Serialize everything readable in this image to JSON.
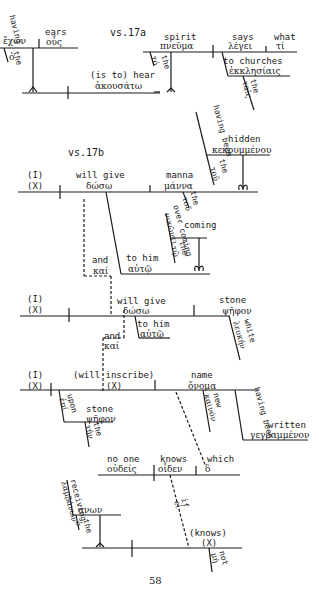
{
  "page": {
    "page_number": "58"
  },
  "verse_17a": {
    "label": "vs.17a",
    "subject": {
      "english": "having",
      "english2": "ears",
      "greek": "ἔχων",
      "participle_english": "having",
      "object_english": "ears",
      "object_greek": "ὦτα"
    },
    "having_label": "having",
    "having_greek": "ἔχων",
    "ears_label": "ears",
    "ears_greek": "οὖς",
    "the_label": "the",
    "the_greek": "ὁ",
    "hear_label": "(is to) hear",
    "hear_greek": "ἀκουσάτω",
    "spirit_label": "spirit",
    "spirit_greek": "πνεῦμα",
    "spirit_the_label": "the",
    "spirit_the_greek": "τό",
    "says_label": "says",
    "says_greek": "λέγει",
    "what_label": "what",
    "what_greek": "τί",
    "churches_label": "to churches",
    "churches_greek": "ἐκκλησίαις",
    "churches_the_label": "the",
    "churches_the_greek": "ταῖς"
  },
  "hidden_clause": {
    "having_been_label": "having been",
    "hidden_label": "hidden",
    "greek": "κεκρυμμένου",
    "the_label": "the",
    "the_greek": "τοῦ"
  },
  "verse_17b": {
    "label": "vs.17b",
    "subject_label": "(I)",
    "subject_x": "(X)",
    "verb_label": "will give",
    "verb_greek": "δώσω",
    "manna_label": "manna",
    "manna_greek": "μάννα",
    "manna_the_label": "the",
    "manna_the_greek": "τοῦ",
    "to_him_label": "to him",
    "to_him_greek": "αὐτῷ",
    "and_label": "and",
    "and_greek": "καί",
    "overcoming_label": "over coming",
    "overcoming_greek": "νικῶντι",
    "overcoming_the_label": "the",
    "overcoming_the_greek": "τῷ"
  },
  "clause_2": {
    "subject_label": "(I)",
    "subject_x": "(X)",
    "verb_label": "will give",
    "verb_greek": "δώσω",
    "to_him_label": "to him",
    "to_him_greek": "αὐτῷ",
    "stone_label": "stone",
    "stone_greek": "ψῆφον",
    "white_label": "white",
    "white_greek": "λευκήν",
    "and_label": "and",
    "and_greek": "καί"
  },
  "clause_3": {
    "subject_label": "(I)",
    "subject_x": "(X)",
    "verb_label": "(will inscribe)",
    "verb_x": "(X)",
    "name_label": "name",
    "name_greek": "ὄνομα",
    "upon_label": "upon",
    "upon_greek": "ἐπί",
    "stone_label": "stone",
    "stone_greek": "ψῆφον",
    "stone_the_label": "the",
    "stone_the_greek": "τήν",
    "new_label": "new",
    "new_greek": "καινόν",
    "written_having_been": "having been",
    "written_label": "written",
    "written_greek": "γεγραμμένον"
  },
  "clause_4": {
    "no_one_label": "no one",
    "no_one_greek": "οὐδείς",
    "knows_label": "knows",
    "knows_greek": "οἶδεν",
    "which_label": "which",
    "which_greek": "ὃ",
    "if_label": "if",
    "if_greek": "εἰ",
    "knows2_label": "(knows)",
    "knows2_x": "(X)",
    "not_label": "not",
    "not_greek": "μή",
    "receiving_label": "receiving",
    "receiving_greek": "λαμβάνων",
    "the_label": "the",
    "the_greek": "ὁ"
  }
}
